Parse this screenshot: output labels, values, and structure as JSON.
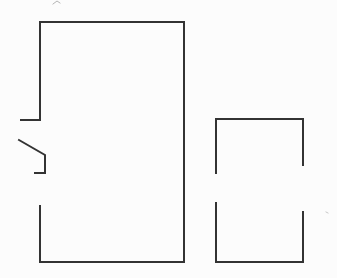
{
  "canvas": {
    "width": 337,
    "height": 278,
    "background_color": "#fcfcfc",
    "stroke_color": "#333333",
    "stroke_width": 2
  },
  "diagram": {
    "type": "line-drawing",
    "shapes": [
      {
        "name": "large-room-outline",
        "kind": "polyline",
        "points": [
          [
            21,
            120
          ],
          [
            40,
            120
          ],
          [
            40,
            22
          ],
          [
            184,
            22
          ],
          [
            184,
            262
          ],
          [
            40,
            262
          ],
          [
            40,
            206
          ]
        ]
      },
      {
        "name": "door-leaf",
        "kind": "polyline",
        "points": [
          [
            19,
            140
          ],
          [
            45,
            155
          ],
          [
            45,
            173
          ],
          [
            35,
            173
          ]
        ]
      },
      {
        "name": "small-room-upper-walls",
        "kind": "polyline",
        "points": [
          [
            216,
            173
          ],
          [
            216,
            119
          ],
          [
            303,
            119
          ],
          [
            303,
            165
          ]
        ]
      },
      {
        "name": "small-room-lower-walls",
        "kind": "polyline",
        "points": [
          [
            216,
            203
          ],
          [
            216,
            262
          ],
          [
            303,
            262
          ],
          [
            303,
            212
          ]
        ]
      }
    ],
    "artifacts": [
      {
        "name": "scan-mark-top",
        "kind": "polyline",
        "points": [
          [
            53,
            4
          ],
          [
            57,
            1
          ],
          [
            60,
            3
          ]
        ],
        "color": "#b5b5b5",
        "width": 1
      },
      {
        "name": "scan-speck-right",
        "kind": "polyline",
        "points": [
          [
            326,
            212
          ],
          [
            328,
            213
          ]
        ],
        "color": "#c8c8c8",
        "width": 1
      }
    ]
  }
}
